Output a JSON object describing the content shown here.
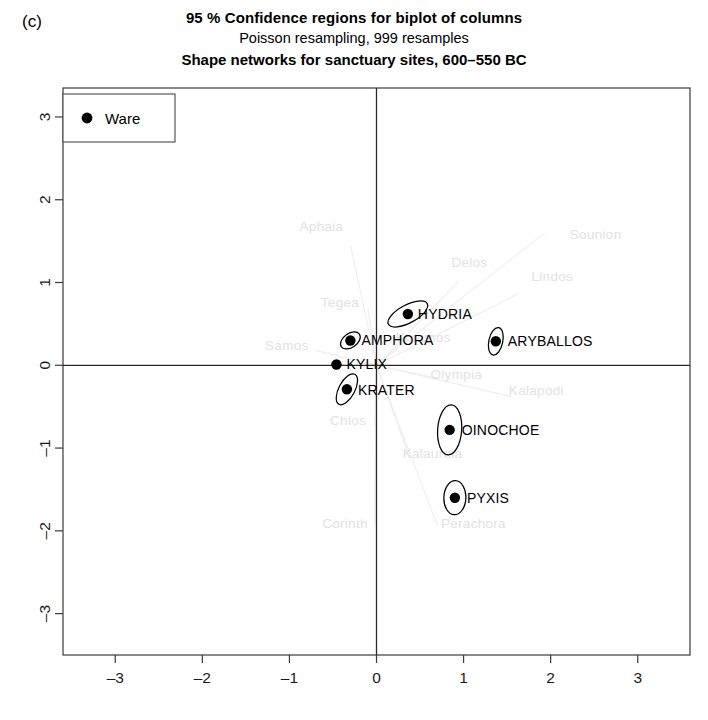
{
  "panel": {
    "label": "(c)"
  },
  "titles": {
    "line1": "95 % Confidence regions for biplot of columns",
    "line2": "Poisson resampling, 999 resamples",
    "line3": "Shape networks for sanctuary sites, 600–550 BC"
  },
  "legend": {
    "label": "Ware",
    "marker": "filled-circle"
  },
  "chart_data": {
    "type": "scatter",
    "title": "95 % Confidence regions for biplot of columns",
    "subtitle": "Poisson resampling, 999 resamples",
    "subtitle2": "Shape networks for sanctuary sites, 600–550 BC",
    "xlabel": "",
    "ylabel": "",
    "xlim": [
      -3.6,
      3.6
    ],
    "ylim": [
      -3.5,
      3.35
    ],
    "xticks": [
      -3,
      -2,
      -1,
      0,
      1,
      2,
      3
    ],
    "yticks": [
      -3,
      -2,
      -1,
      0,
      1,
      2,
      3
    ],
    "grid": false,
    "legend_position": "top-left",
    "series": [
      {
        "name": "Ware",
        "marker": "filled-circle",
        "points": [
          {
            "label": "HYDRIA",
            "x": 0.36,
            "y": 0.62,
            "label_dx": 10,
            "label_dy": 5,
            "ellipse": {
              "rx": 22,
              "ry": 9,
              "rot": -28
            }
          },
          {
            "label": "AMPHORA",
            "x": -0.3,
            "y": 0.3,
            "label_dx": 11,
            "label_dy": 5,
            "ellipse": {
              "rx": 11,
              "ry": 7,
              "rot": -35
            }
          },
          {
            "label": "ARYBALLOS",
            "x": 1.37,
            "y": 0.29,
            "label_dx": 12,
            "label_dy": 5,
            "ellipse": {
              "rx": 7,
              "ry": 14,
              "rot": 12
            }
          },
          {
            "label": "KYLIX",
            "x": -0.46,
            "y": 0.01,
            "label_dx": 10,
            "label_dy": 5,
            "ellipse": null
          },
          {
            "label": "KRATER",
            "x": -0.34,
            "y": -0.29,
            "label_dx": 11,
            "label_dy": 6,
            "ellipse": {
              "rx": 8,
              "ry": 17,
              "rot": 28
            }
          },
          {
            "label": "OINOCHOE",
            "x": 0.84,
            "y": -0.78,
            "label_dx": 12,
            "label_dy": 5,
            "ellipse": {
              "rx": 12,
              "ry": 25,
              "rot": 4
            }
          },
          {
            "label": "PYXIS",
            "x": 0.9,
            "y": -1.6,
            "label_dx": 12,
            "label_dy": 5,
            "ellipse": {
              "rx": 11,
              "ry": 17,
              "rot": 2
            }
          }
        ]
      }
    ],
    "site_rays": [
      {
        "label": "Aphaia",
        "x": -0.3,
        "y": 1.45,
        "label_x": -0.38,
        "label_y": 1.62
      },
      {
        "label": "Delos",
        "x": 0.95,
        "y": 1.02,
        "label_x": 0.86,
        "label_y": 1.19
      },
      {
        "label": "Sounion",
        "x": 1.93,
        "y": 1.6,
        "label_x": 2.22,
        "label_y": 1.52
      },
      {
        "label": "Lindos",
        "x": 1.62,
        "y": 0.86,
        "label_x": 1.78,
        "label_y": 1.02
      },
      {
        "label": "Tegea",
        "x": -0.1,
        "y": 0.69,
        "label_x": -0.2,
        "label_y": 0.7
      },
      {
        "label": "Samos",
        "x": -0.7,
        "y": 0.18,
        "label_x": -0.78,
        "label_y": 0.18
      },
      {
        "label": "Kommos",
        "x": 0.28,
        "y": 0.27,
        "label_x": 0.22,
        "label_y": 0.28
      },
      {
        "label": "Olympia",
        "x": 0.72,
        "y": -0.16,
        "label_x": 0.62,
        "label_y": -0.16
      },
      {
        "label": "Kalapodi",
        "x": 1.55,
        "y": -0.38,
        "label_x": 1.52,
        "label_y": -0.36
      },
      {
        "label": "Chios",
        "x": -0.02,
        "y": -0.74,
        "label_x": -0.12,
        "label_y": -0.72
      },
      {
        "label": "Kalaureia",
        "x": 0.38,
        "y": -1.12,
        "label_x": 0.3,
        "label_y": -1.12
      },
      {
        "label": "Corinth",
        "x": -0.02,
        "y": -1.92,
        "label_x": -0.1,
        "label_y": -1.96
      },
      {
        "label": "Perachora",
        "x": 0.7,
        "y": -1.94,
        "label_x": 0.74,
        "label_y": -1.96
      }
    ]
  }
}
